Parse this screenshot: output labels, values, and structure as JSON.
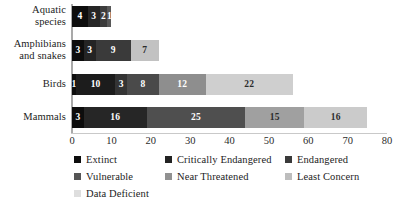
{
  "chart_data": {
    "type": "bar",
    "orientation": "horizontal",
    "stacked": true,
    "title": "",
    "xlabel": "",
    "ylabel": "",
    "xlim": [
      0,
      80
    ],
    "xticks": [
      0,
      10,
      20,
      30,
      40,
      50,
      60,
      70,
      80
    ],
    "grid": false,
    "legend_position": "bottom",
    "categories": [
      "Aquatic species",
      "Amphibians and snakes",
      "Birds",
      "Mammals"
    ],
    "series": [
      {
        "name": "Extinct",
        "color": "#0d0d0d",
        "values": [
          4,
          3,
          1,
          3
        ]
      },
      {
        "name": "Critically Endangered",
        "color": "#1f1f1f",
        "values": [
          3,
          3,
          10,
          16
        ]
      },
      {
        "name": "Endangered",
        "color": "#333333",
        "values": [
          2,
          9,
          3,
          0
        ]
      },
      {
        "name": "Vulnerable",
        "color": "#4d4d4d",
        "values": [
          1,
          0,
          8,
          25
        ]
      },
      {
        "name": "Near Threatened",
        "color": "#8c8c8c",
        "values": [
          0,
          7,
          12,
          15
        ]
      },
      {
        "name": "Least Concern",
        "color": "#c9c9c9",
        "values": [
          0,
          0,
          22,
          16
        ]
      },
      {
        "name": "Data Deficient",
        "color": "#e8e8e8",
        "values": [
          0,
          0,
          0,
          0
        ]
      }
    ],
    "totals": [
      10,
      22,
      56,
      75
    ]
  },
  "rows": [
    {
      "category": "Aquatic species",
      "label_line1": "Aquatic",
      "label_line2": "species",
      "segments": [
        {
          "series": "Extinct",
          "value": 4,
          "label": "4",
          "color": "#0d0d0d",
          "text_color": "#ffffff"
        },
        {
          "series": "Critically Endangered",
          "value": 3,
          "label": "3",
          "color": "#262626",
          "text_color": "#ffffff"
        },
        {
          "series": "Endangered",
          "value": 2,
          "label": "2",
          "color": "#3d3d3d",
          "text_color": "#ffffff"
        },
        {
          "series": "Vulnerable",
          "value": 1,
          "label": "1",
          "color": "#585858",
          "text_color": "#ffffff"
        }
      ]
    },
    {
      "category": "Amphibians and snakes",
      "label_line1": "Amphibians",
      "label_line2": "and snakes",
      "segments": [
        {
          "series": "Extinct",
          "value": 3,
          "label": "3",
          "color": "#0d0d0d",
          "text_color": "#ffffff"
        },
        {
          "series": "Critically Endangered",
          "value": 3,
          "label": "3",
          "color": "#242424",
          "text_color": "#ffffff"
        },
        {
          "series": "Endangered",
          "value": 9,
          "label": "9",
          "color": "#3a3a3a",
          "text_color": "#ffffff"
        },
        {
          "series": "Near Threatened",
          "value": 7,
          "label": "7",
          "color": "#c2c2c2",
          "text_color": "#2b2b2b"
        }
      ]
    },
    {
      "category": "Birds",
      "label_line1": "Birds",
      "label_line2": "",
      "segments": [
        {
          "series": "Extinct",
          "value": 1,
          "label": "1",
          "color": "#0d0d0d",
          "text_color": "#ffffff"
        },
        {
          "series": "Critically Endangered",
          "value": 10,
          "label": "10",
          "color": "#1c1c1c",
          "text_color": "#ffffff"
        },
        {
          "series": "Endangered",
          "value": 3,
          "label": "3",
          "color": "#343434",
          "text_color": "#ffffff"
        },
        {
          "series": "Vulnerable",
          "value": 8,
          "label": "8",
          "color": "#4a4a4a",
          "text_color": "#ffffff"
        },
        {
          "series": "Near Threatened",
          "value": 12,
          "label": "12",
          "color": "#8e8e8e",
          "text_color": "#ffffff"
        },
        {
          "series": "Least Concern",
          "value": 22,
          "label": "22",
          "color": "#cfcfcf",
          "text_color": "#2b2b2b"
        }
      ]
    },
    {
      "category": "Mammals",
      "label_line1": "Mammals",
      "label_line2": "",
      "segments": [
        {
          "series": "Extinct",
          "value": 3,
          "label": "3",
          "color": "#0d0d0d",
          "text_color": "#ffffff"
        },
        {
          "series": "Critically Endangered",
          "value": 16,
          "label": "16",
          "color": "#262626",
          "text_color": "#ffffff"
        },
        {
          "series": "Vulnerable",
          "value": 25,
          "label": "25",
          "color": "#4f4f4f",
          "text_color": "#ffffff"
        },
        {
          "series": "Near Threatened",
          "value": 15,
          "label": "15",
          "color": "#a0a0a0",
          "text_color": "#2b2b2b"
        },
        {
          "series": "Least Concern",
          "value": 16,
          "label": "16",
          "color": "#cbcbcb",
          "text_color": "#2b2b2b"
        }
      ]
    }
  ],
  "xaxis": {
    "ticks": [
      "0",
      "10",
      "20",
      "30",
      "40",
      "50",
      "60",
      "70",
      "80"
    ]
  },
  "legend": [
    {
      "label": "Extinct",
      "color": "#0d0d0d"
    },
    {
      "label": "Critically Endangered",
      "color": "#232323"
    },
    {
      "label": "Endangered",
      "color": "#3a3a3a"
    },
    {
      "label": "Vulnerable",
      "color": "#555555"
    },
    {
      "label": "Near Threatened",
      "color": "#919191"
    },
    {
      "label": "Least Concern",
      "color": "#bdbdbd"
    },
    {
      "label": "Data Deficient",
      "color": "#dedede"
    }
  ]
}
